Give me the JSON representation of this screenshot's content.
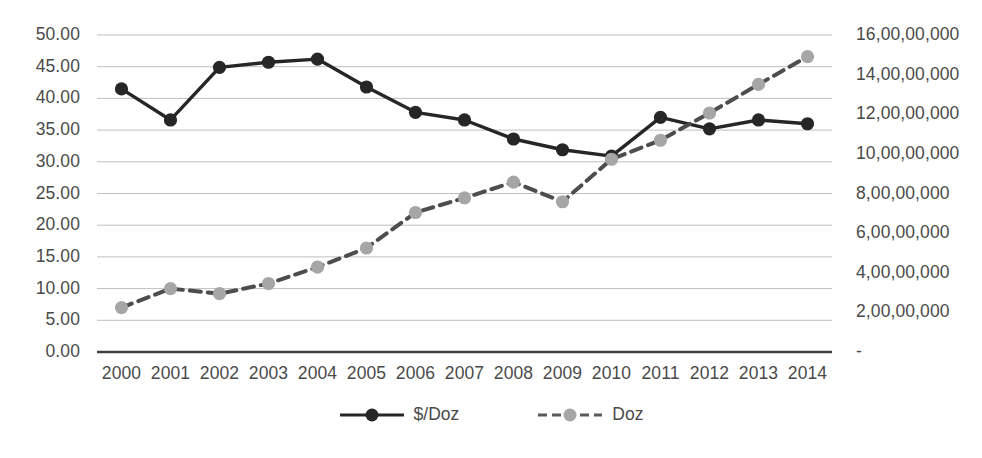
{
  "chart_data": {
    "type": "line",
    "title": "",
    "subtitle": "",
    "xlabel": "",
    "ylabel": "",
    "grid": true,
    "legend_position": "bottom",
    "categories": [
      "2000",
      "2001",
      "2002",
      "2003",
      "2004",
      "2005",
      "2006",
      "2007",
      "2008",
      "2009",
      "2010",
      "2011",
      "2012",
      "2013",
      "2014"
    ],
    "axes": {
      "x": {
        "tick_labels": [
          "2000",
          "2001",
          "2002",
          "2003",
          "2004",
          "2005",
          "2006",
          "2007",
          "2008",
          "2009",
          "2010",
          "2011",
          "2012",
          "2013",
          "2014"
        ]
      },
      "y_left": {
        "title": "",
        "ylim": [
          0,
          50
        ],
        "tick_step": 5,
        "tick_labels": [
          "50.00",
          "45.00",
          "40.00",
          "35.00",
          "30.00",
          "25.00",
          "20.00",
          "15.00",
          "10.00",
          "5.00",
          "0.00"
        ],
        "tick_values": [
          50,
          45,
          40,
          35,
          30,
          25,
          20,
          15,
          10,
          5,
          0
        ]
      },
      "y_right": {
        "title": "",
        "ylim": [
          0,
          160000000
        ],
        "tick_step": 20000000,
        "tick_labels": [
          "16,00,00,000",
          "14,00,00,000",
          "12,00,00,000",
          "10,00,00,000",
          "8,00,00,000",
          "6,00,00,000",
          "4,00,00,000",
          "2,00,00,000",
          "-"
        ],
        "tick_values": [
          160000000,
          140000000,
          120000000,
          100000000,
          80000000,
          60000000,
          40000000,
          20000000,
          0
        ]
      }
    },
    "series": [
      {
        "name": "$/Doz",
        "axis": "left",
        "color": "#262626",
        "line_style": "solid",
        "marker": "circle",
        "values": [
          41.5,
          36.6,
          44.9,
          45.7,
          46.2,
          41.8,
          37.8,
          36.6,
          33.6,
          31.9,
          30.9,
          37.0,
          35.2,
          36.6,
          36.0
        ]
      },
      {
        "name": "Doz",
        "axis": "right",
        "color": "#a6a6a6",
        "line_style": "dashed",
        "marker": "circle",
        "values": [
          22400000,
          32000000,
          29400000,
          34600000,
          42900000,
          52500000,
          70400000,
          77800000,
          85800000,
          75800000,
          97300000,
          106900000,
          120600000,
          135000000,
          149100000
        ],
        "values_left_scale": [
          7.0,
          10.0,
          9.2,
          10.8,
          13.4,
          16.4,
          22.0,
          24.3,
          26.8,
          23.7,
          30.4,
          33.4,
          37.7,
          42.2,
          46.6
        ]
      }
    ]
  },
  "legend": {
    "entries": [
      {
        "label": "$/Doz"
      },
      {
        "label": "Doz"
      }
    ]
  },
  "colors": {
    "series_primary": "#262626",
    "series_secondary": "#a6a6a6",
    "gridline": "#bfbfbf",
    "axis_line": "#404040",
    "text": "#4a4a4a",
    "background": "#ffffff"
  }
}
